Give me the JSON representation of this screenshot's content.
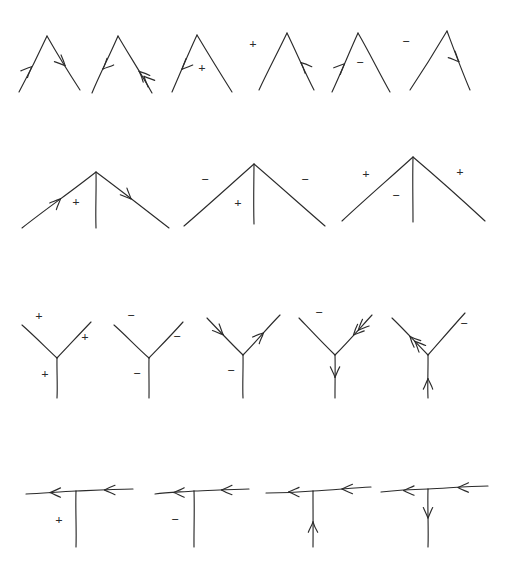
{
  "figure": {
    "background_color": "#ffffff",
    "ink_color": "#2b2b2b",
    "caption": "",
    "rows": [
      {
        "name": "row-lambda-vertices",
        "y": 25,
        "diagrams": [
          {
            "name": "lambda-arrow-in-arrow-out",
            "shape": "lambda",
            "apex": [
              47,
              36
            ],
            "left_end": [
              19,
              92
            ],
            "right_end": [
              80,
              90
            ],
            "left_arrow": {
              "direction": "up-right",
              "position": 0.45,
              "style": "single"
            },
            "right_arrow": {
              "direction": "down-right",
              "position": 0.55,
              "style": "single"
            },
            "signs": []
          },
          {
            "name": "lambda-arrow-down-left-double-up-left",
            "shape": "lambda",
            "apex": [
              118,
              36
            ],
            "left_end": [
              92,
              93
            ],
            "right_end": [
              152,
              93
            ],
            "left_arrow": {
              "direction": "down-left",
              "position": 0.42,
              "style": "single"
            },
            "right_arrow": {
              "direction": "up-left",
              "position": 0.62,
              "style": "double"
            },
            "signs": []
          },
          {
            "name": "lambda-arrow-down-left-plus",
            "shape": "lambda",
            "apex": [
              197,
              35
            ],
            "left_end": [
              172,
              92
            ],
            "right_end": [
              232,
              92
            ],
            "left_arrow": {
              "direction": "down-left",
              "position": 0.4,
              "style": "single"
            },
            "right_arrow": null,
            "signs": [
              {
                "text": "+",
                "x": 202,
                "y": 72,
                "size": 13
              }
            ]
          },
          {
            "name": "lambda-plus-arrow-up-left",
            "shape": "lambda",
            "apex": [
              287,
              33
            ],
            "left_end": [
              259,
              90
            ],
            "right_end": [
              314,
              90
            ],
            "left_arrow": null,
            "right_arrow": {
              "direction": "up-left",
              "position": 0.52,
              "style": "single"
            },
            "signs": [
              {
                "text": "+",
                "x": 253,
                "y": 48,
                "size": 13
              }
            ]
          },
          {
            "name": "lambda-arrow-up-right-minus",
            "shape": "lambda",
            "apex": [
              358,
              33
            ],
            "left_end": [
              332,
              92
            ],
            "right_end": [
              390,
              92
            ],
            "left_arrow": {
              "direction": "up-right",
              "position": 0.48,
              "style": "single"
            },
            "right_arrow": null,
            "signs": [
              {
                "text": "−",
                "x": 360,
                "y": 67,
                "size": 13
              }
            ]
          },
          {
            "name": "lambda-minus-arrow-down-right",
            "shape": "lambda",
            "apex": [
              447,
              31
            ],
            "left_end": [
              410,
              90
            ],
            "right_end": [
              470,
              90
            ],
            "left_arrow": null,
            "right_arrow": {
              "direction": "down-right",
              "position": 0.52,
              "style": "single"
            },
            "signs": [
              {
                "text": "−",
                "x": 406,
                "y": 46,
                "size": 13
              }
            ]
          }
        ]
      },
      {
        "name": "row-three-line-vertices",
        "y": 150,
        "diagrams": [
          {
            "name": "tripod-arrow-in-arrow-out-plus",
            "shape": "tripod",
            "apex": [
              96,
              172
            ],
            "left_end": [
              22,
              228
            ],
            "right_end": [
              169,
              228
            ],
            "stem_end": [
              96,
              228
            ],
            "left_arrow": {
              "direction": "up-right",
              "position": 0.52,
              "style": "single"
            },
            "right_arrow": {
              "direction": "down-right",
              "position": 0.48,
              "style": "single"
            },
            "signs": [
              {
                "text": "+",
                "x": 76,
                "y": 206,
                "size": 13
              }
            ]
          },
          {
            "name": "tripod-minus-minus-plus",
            "shape": "tripod",
            "apex": [
              254,
              164
            ],
            "left_end": [
              184,
              226
            ],
            "right_end": [
              325,
              226
            ],
            "stem_end": [
              254,
              224
            ],
            "left_arrow": null,
            "right_arrow": null,
            "signs": [
              {
                "text": "−",
                "x": 205,
                "y": 184,
                "size": 13
              },
              {
                "text": "−",
                "x": 305,
                "y": 184,
                "size": 13
              },
              {
                "text": "+",
                "x": 238,
                "y": 207,
                "size": 13
              }
            ]
          },
          {
            "name": "tripod-plus-plus-minus",
            "shape": "tripod",
            "apex": [
              413,
              157
            ],
            "left_end": [
              342,
              221
            ],
            "right_end": [
              485,
              221
            ],
            "stem_end": [
              413,
              222
            ],
            "left_arrow": null,
            "right_arrow": null,
            "signs": [
              {
                "text": "+",
                "x": 366,
                "y": 178,
                "size": 13
              },
              {
                "text": "+",
                "x": 460,
                "y": 176,
                "size": 13
              },
              {
                "text": "−",
                "x": 396,
                "y": 200,
                "size": 13
              }
            ]
          }
        ]
      },
      {
        "name": "row-y-vertices",
        "y": 310,
        "diagrams": [
          {
            "name": "y-plus-plus-plus",
            "shape": "wye",
            "center": [
              57,
              358
            ],
            "left_end": [
              22,
              325
            ],
            "right_end": [
              91,
              322
            ],
            "stem_end": [
              57,
              398
            ],
            "left_arrow": null,
            "right_arrow": null,
            "stem_arrow": null,
            "signs": [
              {
                "text": "+",
                "x": 39,
                "y": 320,
                "size": 13
              },
              {
                "text": "+",
                "x": 85,
                "y": 341,
                "size": 13
              },
              {
                "text": "+",
                "x": 45,
                "y": 378,
                "size": 13
              }
            ]
          },
          {
            "name": "y-minus-minus-minus",
            "shape": "wye",
            "center": [
              149,
              358
            ],
            "left_end": [
              114,
              325
            ],
            "right_end": [
              183,
              322
            ],
            "stem_end": [
              149,
              398
            ],
            "left_arrow": null,
            "right_arrow": null,
            "stem_arrow": null,
            "signs": [
              {
                "text": "−",
                "x": 131,
                "y": 320,
                "size": 13
              },
              {
                "text": "−",
                "x": 177,
                "y": 341,
                "size": 13
              },
              {
                "text": "−",
                "x": 137,
                "y": 378,
                "size": 13
              }
            ]
          },
          {
            "name": "y-arrow-in-arrow-out-minus",
            "shape": "wye",
            "center": [
              243,
              355
            ],
            "left_end": [
              207,
              318
            ],
            "right_end": [
              280,
              315
            ],
            "stem_end": [
              243,
              398
            ],
            "left_arrow": {
              "direction": "down-right",
              "position": 0.45,
              "style": "single"
            },
            "right_arrow": {
              "direction": "up-right",
              "position": 0.55,
              "style": "single"
            },
            "stem_arrow": null,
            "signs": [
              {
                "text": "−",
                "x": 231,
                "y": 375,
                "size": 13
              }
            ]
          },
          {
            "name": "y-minus-double-arrow-in-stem-out",
            "shape": "wye",
            "center": [
              335,
              355
            ],
            "left_end": [
              299,
              318
            ],
            "right_end": [
              372,
              315
            ],
            "stem_end": [
              335,
              398
            ],
            "left_arrow": null,
            "right_arrow": {
              "direction": "down-left",
              "position": 0.5,
              "style": "double"
            },
            "stem_arrow": {
              "direction": "down",
              "position": 0.52,
              "style": "single"
            },
            "signs": [
              {
                "text": "−",
                "x": 319,
                "y": 317,
                "size": 13
              }
            ]
          },
          {
            "name": "y-double-arrow-out-minus-stem-in",
            "shape": "wye",
            "center": [
              428,
              355
            ],
            "left_end": [
              392,
              318
            ],
            "right_end": [
              465,
              313
            ],
            "stem_end": [
              428,
              398
            ],
            "left_arrow": {
              "direction": "up-left",
              "position": 0.5,
              "style": "double"
            },
            "right_arrow": null,
            "stem_arrow": {
              "direction": "up",
              "position": 0.55,
              "style": "single"
            },
            "signs": [
              {
                "text": "−",
                "x": 464,
                "y": 328,
                "size": 13
              }
            ]
          }
        ]
      },
      {
        "name": "row-tee-vertices",
        "y": 470,
        "diagrams": [
          {
            "name": "tee-double-left-arrows-plus",
            "shape": "tee",
            "junction": [
              76,
              491
            ],
            "left_end": [
              26,
              494
            ],
            "right_end": [
              133,
              489
            ],
            "stem_end": [
              76,
              547
            ],
            "left_arrow": {
              "direction": "left",
              "position": 0.48,
              "style": "single"
            },
            "right_arrow": {
              "direction": "left",
              "position": 0.5,
              "style": "single"
            },
            "stem_arrow": null,
            "signs": [
              {
                "text": "+",
                "x": 59,
                "y": 524,
                "size": 13
              }
            ]
          },
          {
            "name": "tee-double-left-arrows-minus",
            "shape": "tee",
            "junction": [
              194,
              491
            ],
            "left_end": [
              155,
              494
            ],
            "right_end": [
              249,
              489
            ],
            "stem_end": [
              194,
              547
            ],
            "left_arrow": {
              "direction": "left",
              "position": 0.48,
              "style": "single"
            },
            "right_arrow": {
              "direction": "left",
              "position": 0.5,
              "style": "single"
            },
            "stem_arrow": null,
            "signs": [
              {
                "text": "−",
                "x": 175,
                "y": 524,
                "size": 13
              }
            ]
          },
          {
            "name": "tee-double-left-arrows-stem-up",
            "shape": "tee",
            "junction": [
              313,
              491
            ],
            "left_end": [
              266,
              493
            ],
            "right_end": [
              371,
              487
            ],
            "stem_end": [
              313,
              547
            ],
            "left_arrow": {
              "direction": "left",
              "position": 0.48,
              "style": "single"
            },
            "right_arrow": {
              "direction": "left",
              "position": 0.5,
              "style": "single"
            },
            "stem_arrow": {
              "direction": "up",
              "position": 0.55,
              "style": "single"
            },
            "signs": []
          },
          {
            "name": "tee-double-left-arrows-stem-down",
            "shape": "tee",
            "junction": [
              428,
              489
            ],
            "left_end": [
              381,
              492
            ],
            "right_end": [
              488,
              486
            ],
            "stem_end": [
              428,
              547
            ],
            "left_arrow": {
              "direction": "left",
              "position": 0.48,
              "style": "single"
            },
            "right_arrow": {
              "direction": "left",
              "position": 0.5,
              "style": "single"
            },
            "stem_arrow": {
              "direction": "down",
              "position": 0.5,
              "style": "single"
            },
            "signs": []
          }
        ]
      }
    ]
  }
}
